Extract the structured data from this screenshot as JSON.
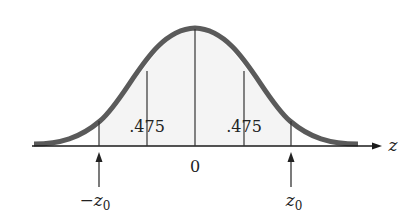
{
  "diagram": {
    "type": "normal-distribution-curve",
    "axis_label": "z",
    "center_label": "0",
    "area_labels": [
      ".475",
      ".475"
    ],
    "left_marker_label": "−z",
    "left_marker_sub": "0",
    "right_marker_label": "z",
    "right_marker_sub": "0",
    "colors": {
      "curve": "#5a5a5a",
      "axis": "#1a1a1a",
      "lines": "#333333",
      "background": "#ffffff"
    }
  }
}
